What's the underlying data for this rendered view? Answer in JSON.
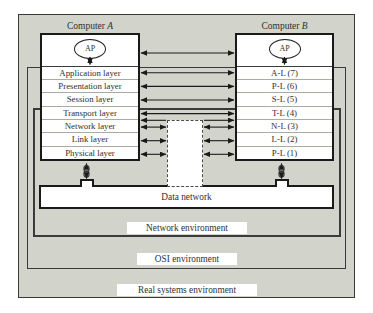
{
  "diagram": {
    "computer_a": {
      "title_prefix": "Computer",
      "title_letter": "A",
      "ap_label": "AP",
      "layers": [
        "Application layer",
        "Presentation layer",
        "Session layer",
        "Transport layer",
        "Network layer",
        "Link layer",
        "Physical layer"
      ]
    },
    "computer_b": {
      "title_prefix": "Computer",
      "title_letter": "B",
      "ap_label": "AP",
      "layers": [
        "A-L (7)",
        "P-L (6)",
        "S-L (5)",
        "T-L (4)",
        "N-L (3)",
        "L-L (2)",
        "P-L (1)"
      ]
    },
    "data_network_label": "Data network",
    "environments": {
      "network": "Network environment",
      "osi": "OSI environment",
      "real": "Real systems environment"
    }
  },
  "colors": {
    "background": "#d2d4cb",
    "box_border": "#1a1a1a",
    "env_border": "#3a3a3a",
    "row_separator": "#a9aca1",
    "arrow": "#1a1a1a",
    "dashed_relay": "#4a4a4a",
    "text": "#2f2f2f"
  }
}
